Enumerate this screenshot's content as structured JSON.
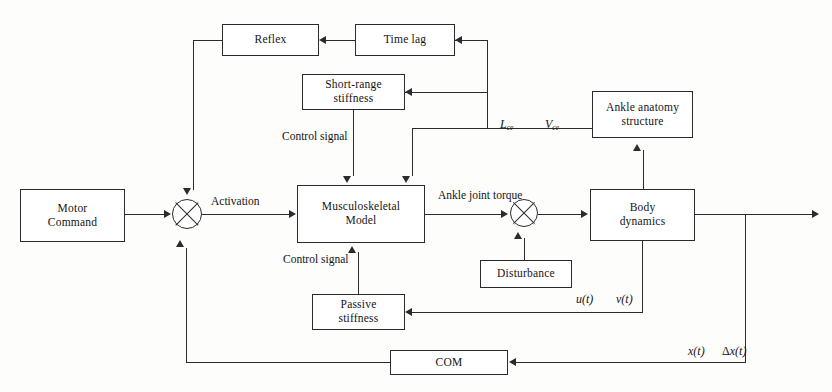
{
  "diagram": {
    "type": "control-system-block-diagram",
    "blocks": [
      {
        "id": "motor-command",
        "label_line1": "Motor",
        "label_line2": "Command"
      },
      {
        "id": "reflex",
        "label_line1": "Reflex",
        "label_line2": ""
      },
      {
        "id": "time-lag",
        "label_line1": "Time lag",
        "label_line2": ""
      },
      {
        "id": "short-range-stiffness",
        "label_line1": "Short-range",
        "label_line2": "stiffness"
      },
      {
        "id": "musculoskeletal-model",
        "label_line1": "Musculoskeletal",
        "label_line2": "Model"
      },
      {
        "id": "ankle-anatomy-structure",
        "label_line1": "Ankle anatomy",
        "label_line2": "structure"
      },
      {
        "id": "body-dynamics",
        "label_line1": "Body",
        "label_line2": "dynamics"
      },
      {
        "id": "disturbance",
        "label_line1": "Disturbance",
        "label_line2": ""
      },
      {
        "id": "passive-stiffness",
        "label_line1": "Passive",
        "label_line2": "stiffness"
      },
      {
        "id": "com",
        "label_line1": "COM",
        "label_line2": ""
      }
    ],
    "junctions": [
      {
        "id": "sum-activation",
        "symbol": "crossed-circle"
      },
      {
        "id": "sum-torque",
        "symbol": "crossed-circle"
      }
    ],
    "signals": {
      "activation": "Activation",
      "control_signal_upper_line1": "Control",
      "control_signal_upper_line2": "signal",
      "control_signal_lower_line1": "Control",
      "control_signal_lower_line2": "signal",
      "ankle_joint_torque_line1": "Ankle joint",
      "ankle_joint_torque_line2": "torque",
      "l_ce": "L",
      "l_ce_sub": "ce",
      "v_ce": "V",
      "v_ce_sub": "ce",
      "u_t": "u(t)",
      "v_t": "v(t)",
      "x_t": "x(t)",
      "delta_x_t": "x(t)",
      "delta_symbol": "Δ"
    },
    "colors": {
      "line": "#2b2b2b",
      "background": "#fdfdfc",
      "text": "#141414"
    }
  }
}
